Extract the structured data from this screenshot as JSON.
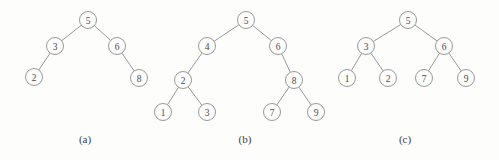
{
  "figure": {
    "background_color": "#fdfdfc",
    "node_stroke_color": "#8d8d8d",
    "edge_color": "#8d8d8d",
    "label_color": "#4a4a4a",
    "node_radius": 8.5
  },
  "panels": [
    {
      "id": "panel-a",
      "caption": "(a)",
      "caption_x": 85,
      "caption_y": 133,
      "nodes": [
        {
          "label": "5",
          "x": 88,
          "y": 20
        },
        {
          "label": "3",
          "x": 55,
          "y": 46
        },
        {
          "label": "6",
          "x": 117,
          "y": 46
        },
        {
          "label": "2",
          "x": 34,
          "y": 77
        },
        {
          "label": "8",
          "x": 139,
          "y": 78
        }
      ],
      "edges": [
        {
          "from": "5",
          "to": "3"
        },
        {
          "from": "5",
          "to": "6"
        },
        {
          "from": "3",
          "to": "2"
        },
        {
          "from": "6",
          "to": "8"
        }
      ]
    },
    {
      "id": "panel-b",
      "caption": "(b)",
      "caption_x": 245,
      "caption_y": 133,
      "nodes": [
        {
          "label": "5",
          "x": 246,
          "y": 20
        },
        {
          "label": "4",
          "x": 207,
          "y": 46
        },
        {
          "label": "6",
          "x": 278,
          "y": 46
        },
        {
          "label": "2",
          "x": 183,
          "y": 80
        },
        {
          "label": "8",
          "x": 294,
          "y": 80
        },
        {
          "label": "1",
          "x": 163,
          "y": 112
        },
        {
          "label": "3",
          "x": 207,
          "y": 112
        },
        {
          "label": "7",
          "x": 272,
          "y": 112
        },
        {
          "label": "9",
          "x": 316,
          "y": 112
        }
      ],
      "edges": [
        {
          "from": "5",
          "to": "4"
        },
        {
          "from": "5",
          "to": "6"
        },
        {
          "from": "4",
          "to": "2"
        },
        {
          "from": "6",
          "to": "8"
        },
        {
          "from": "2",
          "to": "1"
        },
        {
          "from": "2",
          "to": "3"
        },
        {
          "from": "8",
          "to": "7"
        },
        {
          "from": "8",
          "to": "9"
        }
      ]
    },
    {
      "id": "panel-c",
      "caption": "(c)",
      "caption_x": 405,
      "caption_y": 133,
      "nodes": [
        {
          "label": "5",
          "x": 408,
          "y": 20
        },
        {
          "label": "3",
          "x": 366,
          "y": 46
        },
        {
          "label": "6",
          "x": 444,
          "y": 46
        },
        {
          "label": "1",
          "x": 347,
          "y": 78
        },
        {
          "label": "2",
          "x": 388,
          "y": 78
        },
        {
          "label": "7",
          "x": 424,
          "y": 78
        },
        {
          "label": "9",
          "x": 466,
          "y": 78
        }
      ],
      "edges": [
        {
          "from": "5",
          "to": "3"
        },
        {
          "from": "5",
          "to": "6"
        },
        {
          "from": "3",
          "to": "1"
        },
        {
          "from": "3",
          "to": "2"
        },
        {
          "from": "6",
          "to": "7"
        },
        {
          "from": "6",
          "to": "9"
        }
      ]
    }
  ]
}
